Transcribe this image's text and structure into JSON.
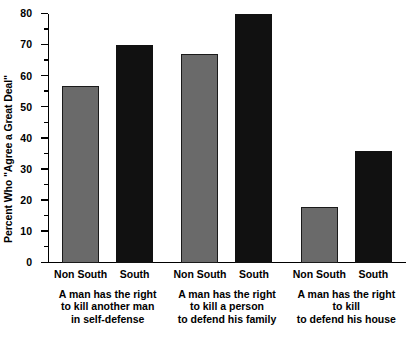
{
  "chart_data": {
    "type": "bar",
    "title": "",
    "subtitle": "",
    "xlabel": "",
    "ylabel": "Percent Who \"Agree a Great Deal\"",
    "ylim": [
      0,
      80
    ],
    "ytick_step": 10,
    "yminor_step": 5,
    "grid": false,
    "legend_position": "none",
    "categories": [
      "A man has the right to kill another man in self-defense",
      "A man has the right to kill a person to defend his family",
      "A man has the right to kill to defend his house"
    ],
    "category_lines": [
      [
        "A man has the right",
        "to kill another man",
        "in self-defense"
      ],
      [
        "A man has the right",
        "to kill a person",
        "to defend his family"
      ],
      [
        "A man has the right",
        "to kill",
        "to defend his house"
      ]
    ],
    "series": [
      {
        "name": "Non South",
        "color": "#6a6a6a",
        "values": [
          57,
          67,
          18
        ]
      },
      {
        "name": "South",
        "color": "#111111",
        "values": [
          70,
          80,
          36
        ]
      }
    ],
    "ytick_labels": [
      "0",
      "10",
      "20",
      "30",
      "40",
      "50",
      "60",
      "70",
      "80"
    ],
    "ytick_values": [
      0,
      10,
      20,
      30,
      40,
      50,
      60,
      70,
      80
    ],
    "yminor_values": [
      5,
      15,
      25,
      35,
      45,
      55,
      65,
      75
    ]
  }
}
